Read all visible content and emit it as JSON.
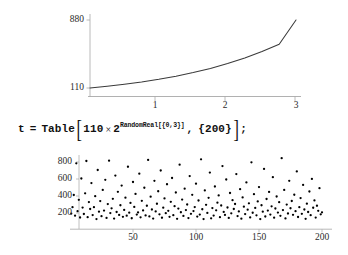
{
  "document": {
    "background_color": "#ffffff",
    "ink_color": "#1a1a1a"
  },
  "top_plot": {
    "name": "exponential-curve-plot",
    "y_ticks": [
      "880",
      "110"
    ],
    "x_ticks": [
      "1",
      "2",
      "3"
    ],
    "axis_color": "#9a9a9a",
    "curve_color": "#3a3a3a"
  },
  "expression": {
    "assign_var": "t",
    "equals": "=",
    "function": "Table",
    "open_bracket": "[",
    "base": "110",
    "times": "×",
    "power_base": "2",
    "exponent": "RandomReal[{0,3}]",
    "comma": ",",
    "count": "{200}",
    "close_bracket": "]",
    "terminator": ";"
  },
  "bottom_plot": {
    "name": "random-sample-scatter-plot",
    "y_ticks": [
      "800",
      "600",
      "400",
      "200"
    ],
    "x_ticks": [
      "50",
      "100",
      "150",
      "200"
    ],
    "axis_color": "#9a9a9a",
    "point_color": "#000000"
  },
  "chart_data": [
    {
      "type": "line",
      "name": "exponential-curve",
      "title": "",
      "xlabel": "",
      "ylabel": "",
      "xlim": [
        0,
        3
      ],
      "ylim": [
        110,
        880
      ],
      "xticks": [
        1,
        2,
        3
      ],
      "yticks": [
        110,
        880
      ],
      "grid": false,
      "legend": false,
      "function": "110 * 2^x",
      "x": [
        0,
        0.25,
        0.5,
        0.75,
        1,
        1.25,
        1.5,
        1.75,
        2,
        2.25,
        2.5,
        2.75,
        3
      ],
      "y": [
        110,
        131,
        156,
        185,
        220,
        262,
        311,
        370,
        440,
        523,
        622,
        740,
        880
      ]
    },
    {
      "type": "scatter",
      "name": "random-sample-scatter",
      "title": "",
      "xlabel": "",
      "ylabel": "",
      "xlim": [
        0,
        205
      ],
      "ylim": [
        100,
        880
      ],
      "xticks": [
        50,
        100,
        150,
        200
      ],
      "yticks": [
        200,
        400,
        600,
        800
      ],
      "grid": false,
      "legend": false,
      "n_points": 200,
      "distribution": "110 * 2^RandomReal[{0,3}]",
      "points": [
        [
          1,
          193
        ],
        [
          2,
          268
        ],
        [
          3,
          412
        ],
        [
          4,
          169
        ],
        [
          5,
          784
        ],
        [
          6,
          222
        ],
        [
          7,
          355
        ],
        [
          8,
          147
        ],
        [
          9,
          606
        ],
        [
          10,
          264
        ],
        [
          11,
          188
        ],
        [
          12,
          432
        ],
        [
          13,
          812
        ],
        [
          14,
          151
        ],
        [
          15,
          329
        ],
        [
          16,
          247
        ],
        [
          17,
          552
        ],
        [
          18,
          176
        ],
        [
          19,
          268
        ],
        [
          20,
          398
        ],
        [
          21,
          128
        ],
        [
          22,
          706
        ],
        [
          23,
          215
        ],
        [
          24,
          340
        ],
        [
          25,
          163
        ],
        [
          26,
          472
        ],
        [
          27,
          228
        ],
        [
          28,
          590
        ],
        [
          29,
          142
        ],
        [
          30,
          305
        ],
        [
          31,
          816
        ],
        [
          32,
          199
        ],
        [
          33,
          255
        ],
        [
          34,
          367
        ],
        [
          35,
          134
        ],
        [
          36,
          640
        ],
        [
          37,
          212
        ],
        [
          38,
          449
        ],
        [
          39,
          177
        ],
        [
          40,
          291
        ],
        [
          41,
          523
        ],
        [
          42,
          155
        ],
        [
          43,
          236
        ],
        [
          44,
          380
        ],
        [
          45,
          168
        ],
        [
          46,
          744
        ],
        [
          47,
          204
        ],
        [
          48,
          318
        ],
        [
          49,
          138
        ],
        [
          50,
          565
        ],
        [
          51,
          272
        ],
        [
          52,
          425
        ],
        [
          53,
          181
        ],
        [
          54,
          207
        ],
        [
          55,
          663
        ],
        [
          56,
          149
        ],
        [
          57,
          343
        ],
        [
          58,
          230
        ],
        [
          59,
          497
        ],
        [
          60,
          172
        ],
        [
          61,
          285
        ],
        [
          62,
          824
        ],
        [
          63,
          160
        ],
        [
          64,
          392
        ],
        [
          65,
          241
        ],
        [
          66,
          134
        ],
        [
          67,
          578
        ],
        [
          68,
          218
        ],
        [
          69,
          309
        ],
        [
          70,
          456
        ],
        [
          71,
          185
        ],
        [
          72,
          700
        ],
        [
          73,
          144
        ],
        [
          74,
          263
        ],
        [
          75,
          371
        ],
        [
          76,
          198
        ],
        [
          77,
          538
        ],
        [
          78,
          226
        ],
        [
          79,
          155
        ],
        [
          80,
          332
        ],
        [
          81,
          612
        ],
        [
          82,
          174
        ],
        [
          83,
          280
        ],
        [
          84,
          441
        ],
        [
          85,
          131
        ],
        [
          86,
          252
        ],
        [
          87,
          768
        ],
        [
          88,
          209
        ],
        [
          89,
          358
        ],
        [
          90,
          166
        ],
        [
          91,
          486
        ],
        [
          92,
          235
        ],
        [
          93,
          300
        ],
        [
          94,
          140
        ],
        [
          95,
          634
        ],
        [
          96,
          190
        ],
        [
          97,
          414
        ],
        [
          98,
          223
        ],
        [
          99,
          270
        ],
        [
          100,
          545
        ],
        [
          101,
          158
        ],
        [
          102,
          347
        ],
        [
          103,
          182
        ],
        [
          104,
          832
        ],
        [
          105,
          244
        ],
        [
          106,
          128
        ],
        [
          107,
          466
        ],
        [
          108,
          296
        ],
        [
          109,
          201
        ],
        [
          110,
          378
        ],
        [
          111,
          676
        ],
        [
          112,
          137
        ],
        [
          113,
          258
        ],
        [
          114,
          170
        ],
        [
          115,
          512
        ],
        [
          116,
          231
        ],
        [
          117,
          322
        ],
        [
          118,
          407
        ],
        [
          119,
          151
        ],
        [
          120,
          288
        ],
        [
          121,
          752
        ],
        [
          122,
          213
        ],
        [
          123,
          177
        ],
        [
          124,
          594
        ],
        [
          125,
          265
        ],
        [
          126,
          142
        ],
        [
          127,
          435
        ],
        [
          128,
          196
        ],
        [
          129,
          351
        ],
        [
          130,
          247
        ],
        [
          131,
          306
        ],
        [
          132,
          658
        ],
        [
          133,
          164
        ],
        [
          134,
          219
        ],
        [
          135,
          480
        ],
        [
          136,
          133
        ],
        [
          137,
          383
        ],
        [
          138,
          275
        ],
        [
          139,
          187
        ],
        [
          140,
          560
        ],
        [
          141,
          239
        ],
        [
          142,
          314
        ],
        [
          143,
          148
        ],
        [
          144,
          796
        ],
        [
          145,
          203
        ],
        [
          146,
          422
        ],
        [
          147,
          260
        ],
        [
          148,
          173
        ],
        [
          149,
          336
        ],
        [
          150,
          505
        ],
        [
          151,
          129
        ],
        [
          152,
          291
        ],
        [
          153,
          216
        ],
        [
          154,
          718
        ],
        [
          155,
          159
        ],
        [
          156,
          365
        ],
        [
          157,
          228
        ],
        [
          158,
          448
        ],
        [
          159,
          181
        ],
        [
          160,
          279
        ],
        [
          161,
          622
        ],
        [
          162,
          145
        ],
        [
          163,
          253
        ],
        [
          164,
          394
        ],
        [
          165,
          205
        ],
        [
          166,
          327
        ],
        [
          167,
          167
        ],
        [
          168,
          845
        ],
        [
          169,
          234
        ],
        [
          170,
          471
        ],
        [
          171,
          136
        ],
        [
          172,
          299
        ],
        [
          173,
          194
        ],
        [
          174,
          578
        ],
        [
          175,
          256
        ],
        [
          176,
          341
        ],
        [
          177,
          178
        ],
        [
          178,
          415
        ],
        [
          179,
          222
        ],
        [
          180,
          689
        ],
        [
          181,
          153
        ],
        [
          182,
          268
        ],
        [
          183,
          376
        ],
        [
          184,
          190
        ],
        [
          185,
          530
        ],
        [
          186,
          241
        ],
        [
          187,
          131
        ],
        [
          188,
          310
        ],
        [
          189,
          212
        ],
        [
          190,
          453
        ],
        [
          191,
          175
        ],
        [
          192,
          601
        ],
        [
          193,
          262
        ],
        [
          194,
          348
        ],
        [
          195,
          146
        ],
        [
          196,
          285
        ],
        [
          197,
          226
        ],
        [
          198,
          492
        ],
        [
          199,
          184
        ],
        [
          200,
          208
        ]
      ]
    }
  ]
}
